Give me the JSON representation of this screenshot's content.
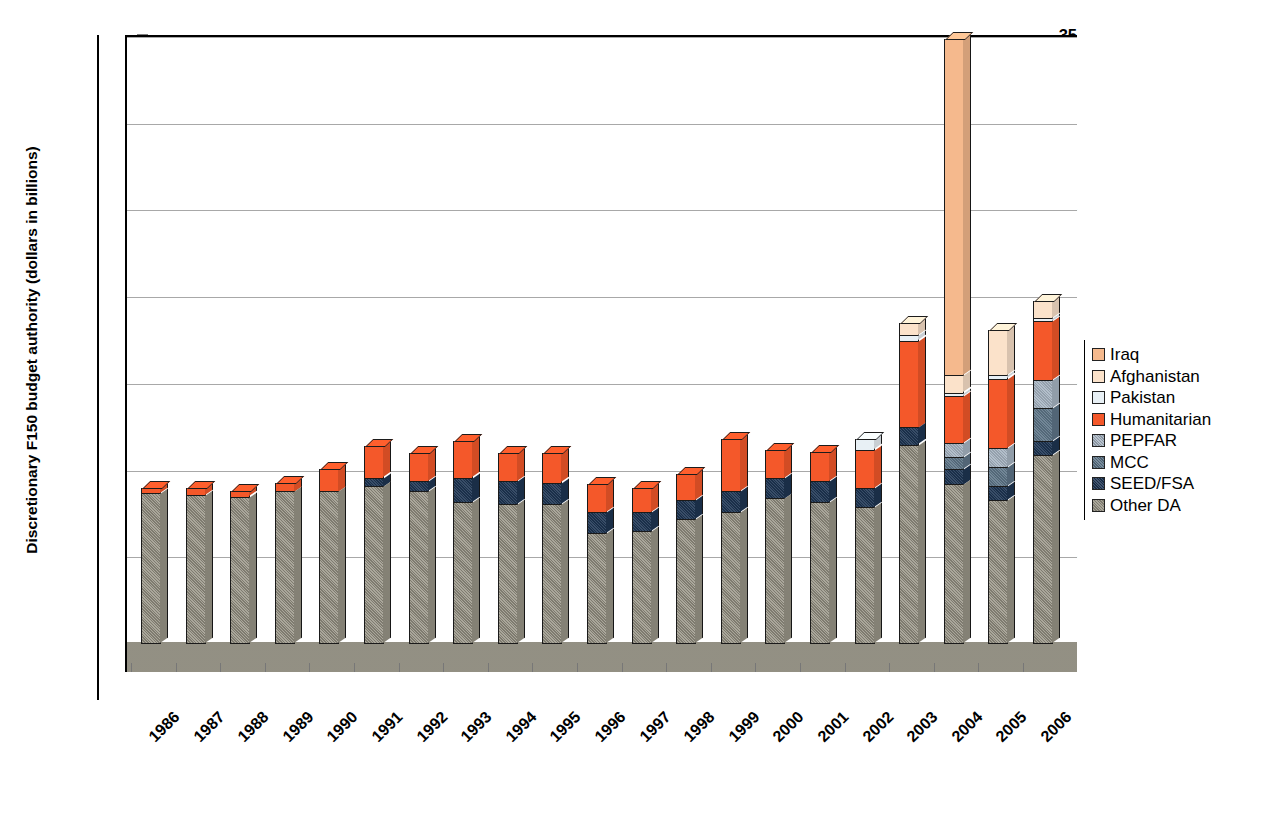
{
  "axes": {
    "y_title": "Discretionary F150 budget authority (dollars in billions)",
    "y_ticks": [
      "0",
      "5",
      "10",
      "15",
      "20",
      "25",
      "30",
      "35"
    ],
    "x_labels": [
      "1986",
      "1987",
      "1988",
      "1989",
      "1990",
      "1991",
      "1992",
      "1993",
      "1994",
      "1995",
      "1996",
      "1997",
      "1998",
      "1999",
      "2000",
      "2001",
      "2002",
      "2003",
      "2004",
      "2005",
      "2006"
    ]
  },
  "legend": {
    "items": [
      {
        "label": "Iraq",
        "color": "#f5b98d"
      },
      {
        "label": "Afghanistan",
        "color": "#fbe2ca"
      },
      {
        "label": "Pakistan",
        "color": "#e8f0f5"
      },
      {
        "label": "Humanitarian",
        "color": "#f4582a"
      },
      {
        "label": "PEPFAR",
        "color": "#a9b6c4"
      },
      {
        "label": "MCC",
        "color": "#5f7689"
      },
      {
        "label": "SEED/FSA",
        "color": "#1e3553"
      },
      {
        "label": "Other DA",
        "color": "#9a9688"
      }
    ]
  },
  "chart_data": {
    "type": "bar",
    "stacked": true,
    "title": "",
    "xlabel": "",
    "ylabel": "Discretionary F150 budget authority (dollars in billions)",
    "ylim": [
      0,
      35
    ],
    "ytick_step": 5,
    "grid": true,
    "legend_position": "right",
    "categories": [
      "1986",
      "1987",
      "1988",
      "1989",
      "1990",
      "1991",
      "1992",
      "1993",
      "1994",
      "1995",
      "1996",
      "1997",
      "1998",
      "1999",
      "2000",
      "2001",
      "2002",
      "2003",
      "2004",
      "2005",
      "2006"
    ],
    "series": [
      {
        "name": "Other DA",
        "color": "#9a9688",
        "values": [
          8.7,
          8.6,
          8.5,
          8.8,
          8.8,
          9.1,
          8.8,
          8.2,
          8.1,
          8.1,
          6.4,
          6.5,
          7.2,
          7.6,
          8.4,
          8.2,
          7.9,
          11.5,
          9.2,
          8.3,
          10.9
        ]
      },
      {
        "name": "SEED/FSA",
        "color": "#1e3553",
        "values": [
          0.0,
          0.0,
          0.0,
          0.0,
          0.0,
          0.5,
          0.6,
          1.4,
          1.3,
          1.2,
          1.2,
          1.1,
          1.1,
          1.2,
          1.2,
          1.2,
          1.1,
          1.0,
          0.9,
          0.8,
          0.8
        ]
      },
      {
        "name": "MCC",
        "color": "#5f7689",
        "values": [
          0.0,
          0.0,
          0.0,
          0.0,
          0.0,
          0.0,
          0.0,
          0.0,
          0.0,
          0.0,
          0.0,
          0.0,
          0.0,
          0.0,
          0.0,
          0.0,
          0.0,
          0.0,
          0.7,
          1.1,
          1.9
        ]
      },
      {
        "name": "PEPFAR",
        "color": "#a9b6c4",
        "values": [
          0.0,
          0.0,
          0.0,
          0.0,
          0.0,
          0.0,
          0.0,
          0.0,
          0.0,
          0.0,
          0.0,
          0.0,
          0.0,
          0.0,
          0.0,
          0.0,
          0.0,
          0.0,
          0.8,
          1.1,
          1.6
        ]
      },
      {
        "name": "Humanitarian",
        "color": "#f4582a",
        "values": [
          0.3,
          0.4,
          0.3,
          0.5,
          1.3,
          1.8,
          1.6,
          2.1,
          1.6,
          1.7,
          1.6,
          1.4,
          1.5,
          3.0,
          1.6,
          1.7,
          2.2,
          5.0,
          2.7,
          4.0,
          3.4
        ]
      },
      {
        "name": "Pakistan",
        "color": "#e8f0f5",
        "values": [
          0.0,
          0.0,
          0.0,
          0.0,
          0.0,
          0.0,
          0.0,
          0.0,
          0.0,
          0.0,
          0.0,
          0.0,
          0.0,
          0.0,
          0.0,
          0.0,
          0.6,
          0.3,
          0.2,
          0.2,
          0.2
        ]
      },
      {
        "name": "Afghanistan",
        "color": "#fbe2ca",
        "values": [
          0.0,
          0.0,
          0.0,
          0.0,
          0.0,
          0.0,
          0.0,
          0.0,
          0.0,
          0.0,
          0.0,
          0.0,
          0.0,
          0.0,
          0.0,
          0.0,
          0.0,
          0.7,
          1.0,
          2.6,
          1.0
        ]
      },
      {
        "name": "Iraq",
        "color": "#f5b98d",
        "values": [
          0.0,
          0.0,
          0.0,
          0.0,
          0.0,
          0.0,
          0.0,
          0.0,
          0.0,
          0.0,
          0.0,
          0.0,
          0.0,
          0.0,
          0.0,
          0.0,
          0.0,
          0.0,
          19.4,
          0.0,
          0.0
        ]
      }
    ],
    "totals": [
      9.0,
      9.0,
      8.8,
      9.3,
      10.1,
      11.4,
      11.0,
      11.7,
      11.0,
      11.0,
      9.2,
      9.0,
      9.8,
      11.8,
      11.2,
      11.1,
      11.8,
      18.5,
      34.9,
      18.1,
      19.8
    ]
  }
}
